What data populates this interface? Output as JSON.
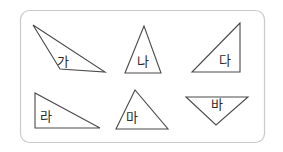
{
  "figure": {
    "canvas": {
      "width": 283,
      "height": 152
    },
    "background_color": "#ffffff",
    "panel": {
      "x": 20.5,
      "y": 10.5,
      "width": 244,
      "height": 132,
      "corner_radius": 9,
      "stroke_color": "#c9c9c9",
      "stroke_width": 1.2,
      "fill_color": "#ffffff"
    },
    "shape_style": {
      "stroke_color": "#4a4a4a",
      "stroke_width": 1.1,
      "label_color": "#2b2b2b",
      "label_font_size": 13
    },
    "shapes": [
      {
        "id": "triangle-ga",
        "label": "가",
        "kind": "obtuse-scalene",
        "points": "33,25 60,69 105,72",
        "label_x": 63,
        "label_y": 62
      },
      {
        "id": "triangle-na",
        "label": "나",
        "kind": "isosceles-up",
        "points": "144,26 125,73 161,73",
        "label_x": 143,
        "label_y": 62
      },
      {
        "id": "triangle-da",
        "label": "다",
        "kind": "right-angle-bottom-right",
        "points": "240,23 192,72 240,72",
        "label_x": 225,
        "label_y": 61
      },
      {
        "id": "triangle-ra",
        "label": "라",
        "kind": "right-angle-bottom-left",
        "points": "35,93 35,128 100,128",
        "label_x": 46,
        "label_y": 117
      },
      {
        "id": "triangle-ma",
        "label": "마",
        "kind": "scalene-up",
        "points": "135,90 116,129 168,129",
        "label_x": 132,
        "label_y": 118
      },
      {
        "id": "triangle-ba",
        "label": "바",
        "kind": "inverted",
        "points": "186,97 248,97 216,125",
        "label_x": 217,
        "label_y": 105
      }
    ]
  }
}
